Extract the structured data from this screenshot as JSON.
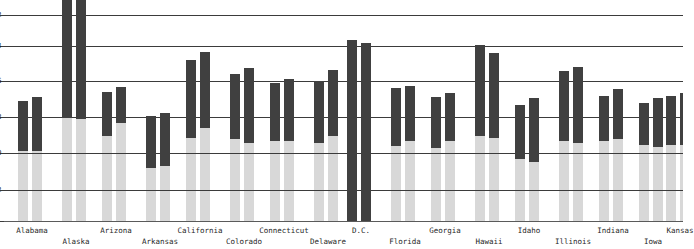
{
  "chart_data": {
    "type": "bar",
    "subtype": "floating-range-bar",
    "title": "",
    "subtitle": "",
    "xlabel": "",
    "ylabel": "",
    "grid": true,
    "legend": null,
    "ylim": [
      0,
      56
    ],
    "y_ticks": [
      4,
      12,
      20,
      28,
      36,
      44,
      52
    ],
    "y_tick_labels": [
      "4",
      "12",
      "20",
      "28",
      "36",
      "44",
      "52"
    ],
    "note": "Y axis tick labels are clipped at the left edge of the screenshot.",
    "categories": [
      "Alabama",
      "Alaska",
      "Arizona",
      "Arkansas",
      "California",
      "Colorado",
      "Connecticut",
      "Delaware",
      "D.C.",
      "Florida",
      "Georgia",
      "Hawaii",
      "Idaho",
      "Illinois",
      "Indiana",
      "Iowa",
      "Kansas"
    ],
    "series": [
      {
        "name": "bar-1",
        "low": [
          20.5,
          36.0,
          25.0,
          17.5,
          28.0,
          27.5,
          26.5,
          26.0,
          4.0,
          24.5,
          24.0,
          28.0,
          21.5,
          26.0,
          26.5,
          25.0,
          26.5
        ],
        "high": [
          31.5,
          60.0,
          34.5,
          28.5,
          43.0,
          40.0,
          38.0,
          38.5,
          47.5,
          34.0,
          32.0,
          45.5,
          31.0,
          41.5,
          36.0,
          33.5,
          35.0
        ]
      },
      {
        "name": "bar-2",
        "low": [
          20.5,
          36.0,
          28.0,
          17.5,
          32.5,
          26.5,
          26.5,
          28.0,
          4.0,
          26.0,
          25.5,
          27.5,
          20.5,
          25.5,
          26.0,
          24.5,
          26.5
        ],
        "high": [
          32.5,
          60.0,
          36.5,
          29.5,
          45.5,
          42.0,
          39.0,
          41.5,
          47.0,
          34.5,
          33.0,
          43.0,
          33.0,
          42.5,
          37.5,
          34.5,
          36.0
        ]
      }
    ],
    "baseline_value": 4,
    "colors": {
      "range_bar": "#404040",
      "background_bar": "#d8d8d8",
      "gridline": "#3b3b3b",
      "axis": "#5a5a5a",
      "plot_background": "#ffffff",
      "text": "#1f1f1f"
    }
  },
  "axis": {
    "y_ticks": [
      {
        "label": "52",
        "y": 15
      },
      {
        "label": "44",
        "y": 46
      },
      {
        "label": "36",
        "y": 81
      },
      {
        "label": "28",
        "y": 117
      },
      {
        "label": "20",
        "y": 153
      },
      {
        "label": "12",
        "y": 190
      },
      {
        "label": "4",
        "y": 221
      }
    ]
  },
  "bars": [
    {
      "state": "Alabama",
      "label_row": 0,
      "center": 32,
      "bars": [
        {
          "x": 18,
          "top": 101,
          "bottom": 151
        },
        {
          "x": 32,
          "top": 97,
          "bottom": 151
        }
      ]
    },
    {
      "state": "Alaska",
      "label_row": 1,
      "center": 76,
      "bars": [
        {
          "x": 62,
          "top": -12,
          "bottom": 118
        },
        {
          "x": 76,
          "top": -12,
          "bottom": 119
        }
      ]
    },
    {
      "state": "Arizona",
      "label_row": 0,
      "center": 116,
      "bars": [
        {
          "x": 102,
          "top": 92,
          "bottom": 136
        },
        {
          "x": 116,
          "top": 87,
          "bottom": 123
        }
      ]
    },
    {
      "state": "Arkansas",
      "label_row": 1,
      "center": 160,
      "bars": [
        {
          "x": 146,
          "top": 116,
          "bottom": 168
        },
        {
          "x": 160,
          "top": 113,
          "bottom": 166
        }
      ]
    },
    {
      "state": "California",
      "label_row": 0,
      "center": 200,
      "bars": [
        {
          "x": 186,
          "top": 60,
          "bottom": 138
        },
        {
          "x": 200,
          "top": 52,
          "bottom": 128
        }
      ]
    },
    {
      "state": "Colorado",
      "label_row": 1,
      "center": 244,
      "bars": [
        {
          "x": 230,
          "top": 74,
          "bottom": 139
        },
        {
          "x": 244,
          "top": 68,
          "bottom": 143
        }
      ]
    },
    {
      "state": "Connecticut",
      "label_row": 0,
      "center": 284,
      "bars": [
        {
          "x": 270,
          "top": 83,
          "bottom": 141
        },
        {
          "x": 284,
          "top": 79,
          "bottom": 141
        }
      ]
    },
    {
      "state": "Delaware",
      "label_row": 1,
      "center": 328,
      "bars": [
        {
          "x": 314,
          "top": 81,
          "bottom": 143
        },
        {
          "x": 328,
          "top": 70,
          "bottom": 136
        }
      ]
    },
    {
      "state": "D.C.",
      "label_row": 0,
      "center": 361,
      "bars": [
        {
          "x": 347,
          "top": 40,
          "bottom": 221
        },
        {
          "x": 361,
          "top": 43,
          "bottom": 221
        }
      ]
    },
    {
      "state": "Florida",
      "label_row": 1,
      "center": 405,
      "bars": [
        {
          "x": 391,
          "top": 88,
          "bottom": 146
        },
        {
          "x": 405,
          "top": 86,
          "bottom": 141
        }
      ]
    },
    {
      "state": "Georgia",
      "label_row": 0,
      "center": 445,
      "bars": [
        {
          "x": 431,
          "top": 97,
          "bottom": 148
        },
        {
          "x": 445,
          "top": 93,
          "bottom": 141
        }
      ]
    },
    {
      "state": "Hawaii",
      "label_row": 1,
      "center": 489,
      "bars": [
        {
          "x": 475,
          "top": 45,
          "bottom": 136
        },
        {
          "x": 489,
          "top": 53,
          "bottom": 138
        }
      ]
    },
    {
      "state": "Idaho",
      "label_row": 0,
      "center": 529,
      "bars": [
        {
          "x": 515,
          "top": 105,
          "bottom": 159
        },
        {
          "x": 529,
          "top": 98,
          "bottom": 162
        }
      ]
    },
    {
      "state": "Illinois",
      "label_row": 1,
      "center": 573,
      "bars": [
        {
          "x": 559,
          "top": 71,
          "bottom": 141
        },
        {
          "x": 573,
          "top": 67,
          "bottom": 143
        }
      ]
    },
    {
      "state": "Indiana",
      "label_row": 0,
      "center": 613,
      "bars": [
        {
          "x": 599,
          "top": 96,
          "bottom": 141
        },
        {
          "x": 613,
          "top": 89,
          "bottom": 139
        }
      ]
    },
    {
      "state": "Iowa",
      "label_row": 1,
      "center": 653,
      "bars": [
        {
          "x": 639,
          "top": 103,
          "bottom": 145
        },
        {
          "x": 653,
          "top": 98,
          "bottom": 147
        }
      ]
    },
    {
      "state": "Kansas",
      "label_row": 0,
      "center": 680,
      "bars": [
        {
          "x": 666,
          "top": 96,
          "bottom": 145
        },
        {
          "x": 680,
          "top": 93,
          "bottom": 145
        }
      ]
    }
  ]
}
